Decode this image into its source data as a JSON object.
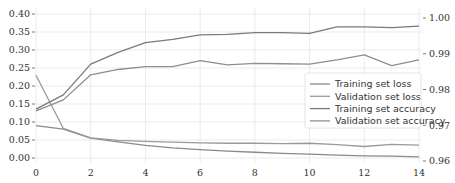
{
  "chart_data": {
    "type": "line",
    "title": "",
    "xlabel": "",
    "ylabel": "",
    "y2label": "",
    "x": [
      0,
      1,
      2,
      3,
      4,
      5,
      6,
      7,
      8,
      9,
      10,
      11,
      12,
      13,
      14
    ],
    "xlim": [
      0,
      14
    ],
    "ylim": [
      0.0,
      0.4
    ],
    "y2lim": [
      0.96,
      1.0
    ],
    "xticks": [
      0,
      2,
      4,
      6,
      8,
      10,
      12,
      14
    ],
    "xtick_labels": [
      "0",
      "2",
      "4",
      "6",
      "8",
      "10",
      "12",
      "14"
    ],
    "yticks": [
      0.0,
      0.05,
      0.1,
      0.15,
      0.2,
      0.25,
      0.3,
      0.35,
      0.4
    ],
    "ytick_labels": [
      "0.00",
      "0.05",
      "0.10",
      "0.15",
      "0.20",
      "0.25",
      "0.30",
      "0.35",
      "0.40"
    ],
    "y2ticks": [
      0.96,
      0.97,
      0.98,
      0.99,
      1.0
    ],
    "y2tick_labels": [
      "0.96",
      "0.97",
      "0.98",
      "0.99",
      "1.00"
    ],
    "grid": true,
    "legend_position": "center right",
    "series": [
      {
        "name": "Training set loss",
        "axis": "left",
        "color": "#8a8a8a",
        "values": [
          0.09,
          0.08,
          0.055,
          0.045,
          0.035,
          0.028,
          0.023,
          0.019,
          0.016,
          0.013,
          0.011,
          0.008,
          0.006,
          0.005,
          0.003
        ]
      },
      {
        "name": "Validation set loss",
        "axis": "left",
        "color": "#9a9a9a",
        "values": [
          0.23,
          0.082,
          0.056,
          0.049,
          0.046,
          0.044,
          0.042,
          0.041,
          0.041,
          0.04,
          0.041,
          0.037,
          0.032,
          0.038,
          0.036
        ]
      },
      {
        "name": "Training set accuracy",
        "axis": "right",
        "color": "#7a7a7a",
        "values": [
          0.9745,
          0.9785,
          0.9871,
          0.9904,
          0.9931,
          0.994,
          0.9953,
          0.9954,
          0.9959,
          0.9959,
          0.9957,
          0.9975,
          0.9975,
          0.9973,
          0.9977
        ]
      },
      {
        "name": "Validation set accuracy",
        "axis": "right",
        "color": "#8e8e8e",
        "values": [
          0.974,
          0.9771,
          0.9841,
          0.9856,
          0.9864,
          0.9864,
          0.9881,
          0.9869,
          0.9873,
          0.9872,
          0.9871,
          0.9883,
          0.9897,
          0.9867,
          0.9883
        ]
      }
    ]
  }
}
